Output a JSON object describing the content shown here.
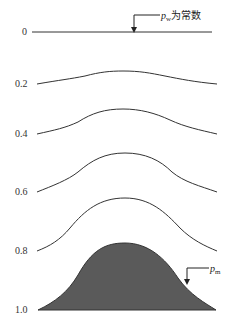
{
  "diagram": {
    "levels": [
      {
        "label": "0",
        "y": 32
      },
      {
        "label": "0.2",
        "y": 84
      },
      {
        "label": "0.4",
        "y": 134
      },
      {
        "label": "0.6",
        "y": 192
      },
      {
        "label": "0.8",
        "y": 251
      },
      {
        "label": "1.0",
        "y": 310
      }
    ],
    "annotations": {
      "top": {
        "symbol": "p",
        "subscript": "w",
        "text": "为常数"
      },
      "bottom": {
        "symbol": "p",
        "subscript": "m"
      }
    },
    "colors": {
      "line": "#333333",
      "fill": "#5a5a5a"
    }
  }
}
